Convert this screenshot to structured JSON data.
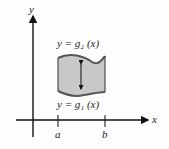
{
  "diagram": {
    "y_axis_label": "y",
    "x_axis_label": "x",
    "upper_curve_label": "y = g₂ (x)",
    "lower_curve_label": "y = g₁ (x)",
    "tick_a": "a",
    "tick_b": "b",
    "colors": {
      "region_fill": "#c8c8c8",
      "curve": "#555555",
      "axis": "#111111"
    }
  }
}
